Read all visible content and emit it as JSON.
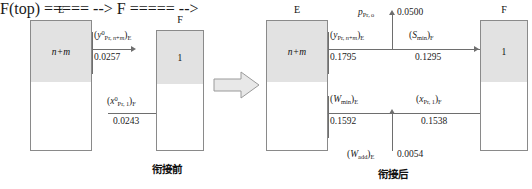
{
  "diagram": {
    "caption_before": "衔接前",
    "caption_after": "衔接后",
    "before": {
      "column_E": {
        "header": "E",
        "segment_label": "n+m"
      },
      "column_F": {
        "header": "F",
        "segment_label": "1"
      },
      "annotations": [
        {
          "symbol_html": "(<i>y</i><sup>0</sup><sub class=\"vsub\">Pr,&#8201;<i>n</i>+<i>m</i></sub>)<sub class=\"vsub\">E</sub>",
          "value": "0.0257"
        },
        {
          "symbol_html": "(<i>x</i><sup>0</sup><sub class=\"vsub\">Pr,&#8201;1</sub>)<sub class=\"vsub\">F</sub>",
          "value": "0.0243"
        }
      ]
    },
    "after": {
      "column_E": {
        "header": "E",
        "segment_label": "n+m"
      },
      "column_F": {
        "header": "F",
        "segment_label": "1"
      },
      "annotations": [
        {
          "symbol_html": "<i>p</i><sub class=\"vsub\">Pr,&#8201;o</sub>",
          "value": "0.0500"
        },
        {
          "symbol_html": "(<i>y</i><sub class=\"vsub\">Pr,&#8201;<i>n</i>+<i>m</i></sub>)<sub class=\"vsub\">E</sub>",
          "value": "0.1795"
        },
        {
          "symbol_html": "(<i>S</i><sub class=\"vsub\">min</sub>)<sub class=\"vsub\">F</sub>",
          "value": "0.1295"
        },
        {
          "symbol_html": "(<i>W</i><sub class=\"vsub\">min</sub>)<sub class=\"vsub\">E</sub>",
          "value": "0.1592"
        },
        {
          "symbol_html": "(<i>x</i><sub class=\"vsub\">Pr,&#8201;1</sub>)<sub class=\"vsub\">F</sub>",
          "value": "0.1538"
        },
        {
          "symbol_html": "(<i>W</i><sub class=\"vsub\">add</sub>)<sub class=\"vsub\">E</sub>",
          "value": "0.0054"
        }
      ]
    },
    "colors": {
      "segment_fill": "#e2e2e2",
      "border": "#8a8a8a",
      "line": "#6e6e6e",
      "arrow_fill": "#e8e8e8",
      "arrow_stroke": "#9a9a9a"
    }
  }
}
